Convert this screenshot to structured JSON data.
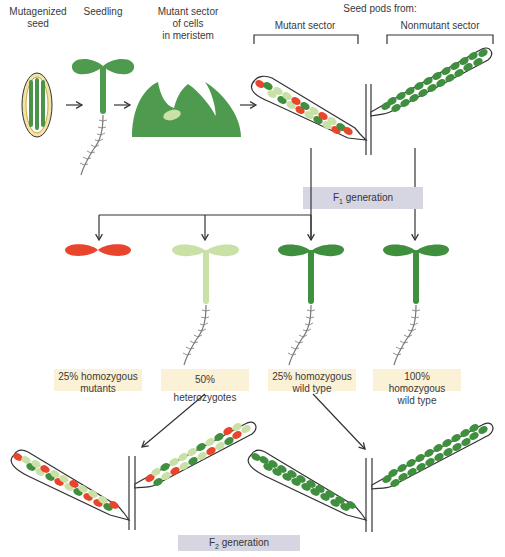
{
  "labels": {
    "mutagenized_seed": "Mutagenized\nseed",
    "seedling": "Seedling",
    "mutant_sector_meristem": "Mutant sector\nof cells\nin meristem",
    "seed_pods_from": "Seed pods from:",
    "mutant_sector": "Mutant sector",
    "nonmutant_sector": "Nonmutant sector"
  },
  "generations": {
    "f1_prefix": "F",
    "f1_sub": "1",
    "f1_suffix": " generation",
    "f2_prefix": "F",
    "f2_sub": "2",
    "f2_suffix": " generation"
  },
  "outcomes": [
    {
      "label": "25% homozygous\nmutants",
      "color": "#e8452c"
    },
    {
      "label": "50% heterozygotes",
      "color": "#c9e0a6"
    },
    {
      "label": "25% homozygous\nwild type",
      "color": "#3f8f3f"
    },
    {
      "label": "100% homozygous\nwild type",
      "color": "#3f8f3f"
    }
  ],
  "colors": {
    "wild_type": "#3f8f3f",
    "heterozygote": "#c9e0a6",
    "mutant": "#e8452c",
    "seed_coat": "#e8c86a",
    "label_box": "#fbf1d6",
    "generation_box": "#d6d6e3"
  }
}
